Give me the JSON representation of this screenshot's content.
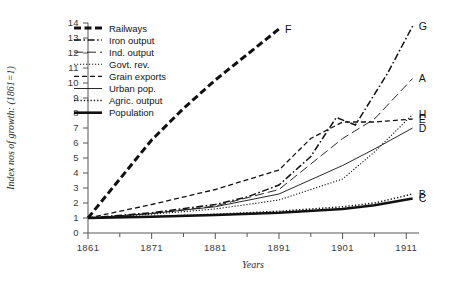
{
  "chart_data": {
    "type": "line",
    "title": "",
    "xlabel": "Years",
    "ylabel": "Index nos of growth: (1861=1)",
    "xlim": [
      1861,
      1913
    ],
    "ylim": [
      0,
      14
    ],
    "xticks": [
      1861,
      1871,
      1881,
      1891,
      1901,
      1911
    ],
    "xticklabels": [
      "1861",
      "1871",
      "1881",
      "1891",
      "1901",
      "1911"
    ],
    "xminorticks": [
      1866,
      1876,
      1886,
      1896,
      1906
    ],
    "yticks": [
      0,
      1,
      2,
      3,
      4,
      5,
      6,
      7,
      8,
      9,
      10,
      11,
      12,
      13,
      14
    ],
    "yticklabels": [
      "0",
      "1",
      "2",
      "3",
      "4",
      "5",
      "6",
      "7",
      "8",
      "9",
      "10",
      "11",
      "12",
      "13",
      "14"
    ],
    "grid": false,
    "legend_position": "upper-left-inside",
    "series": [
      {
        "name": "Railways",
        "end_label": "F",
        "style": "thick-dashed",
        "x": [
          1861,
          1866,
          1871,
          1876,
          1881,
          1886,
          1891
        ],
        "values": [
          1.0,
          3.6,
          6.2,
          8.3,
          10.2,
          11.9,
          13.6
        ]
      },
      {
        "name": "Iron output",
        "end_label": "G",
        "style": "dash-dot",
        "x": [
          1861,
          1871,
          1881,
          1886,
          1891,
          1896,
          1900,
          1903,
          1908,
          1912
        ],
        "values": [
          1.0,
          1.35,
          1.9,
          2.4,
          3.2,
          5.1,
          7.7,
          7.2,
          10.6,
          13.8
        ]
      },
      {
        "name": "Ind. output",
        "end_label": "A",
        "style": "long-dash",
        "x": [
          1861,
          1871,
          1881,
          1891,
          1896,
          1901,
          1906,
          1912
        ],
        "values": [
          1.0,
          1.3,
          1.8,
          2.9,
          4.6,
          6.3,
          7.6,
          10.3
        ]
      },
      {
        "name": "Govt. rev.",
        "end_label": "H",
        "style": "dash-dot-dot",
        "x": [
          1861,
          1871,
          1881,
          1891,
          1901,
          1906,
          1912
        ],
        "values": [
          1.0,
          1.25,
          1.6,
          2.2,
          3.6,
          5.4,
          7.9
        ]
      },
      {
        "name": "Grain exports",
        "end_label": "E",
        "style": "dashed",
        "x": [
          1861,
          1871,
          1881,
          1891,
          1896,
          1901,
          1906,
          1912
        ],
        "values": [
          1.0,
          1.9,
          2.9,
          4.2,
          6.3,
          7.4,
          7.4,
          7.6
        ]
      },
      {
        "name": "Urban pop.",
        "end_label": "D",
        "style": "thin-solid",
        "x": [
          1861,
          1871,
          1881,
          1891,
          1901,
          1906,
          1912
        ],
        "values": [
          1.0,
          1.3,
          1.75,
          2.6,
          4.5,
          5.6,
          7.0
        ]
      },
      {
        "name": "Agric. output",
        "end_label": "B",
        "style": "dotted",
        "x": [
          1861,
          1871,
          1881,
          1891,
          1901,
          1906,
          1912
        ],
        "values": [
          1.0,
          1.1,
          1.25,
          1.45,
          1.75,
          2.0,
          2.6
        ]
      },
      {
        "name": "Population",
        "end_label": "C",
        "style": "thick-solid",
        "x": [
          1861,
          1871,
          1881,
          1891,
          1901,
          1906,
          1912
        ],
        "values": [
          1.0,
          1.08,
          1.2,
          1.35,
          1.6,
          1.85,
          2.3
        ]
      }
    ]
  },
  "legend": {
    "items": [
      {
        "label": "Railways"
      },
      {
        "label": "Iron output"
      },
      {
        "label": "Ind. output"
      },
      {
        "label": "Govt. rev."
      },
      {
        "label": "Grain exports"
      },
      {
        "label": "Urban pop."
      },
      {
        "label": "Agric. output"
      },
      {
        "label": "Population"
      }
    ]
  },
  "colors": {
    "ink": "#111111",
    "axis": "#55565a",
    "background": "#ffffff"
  }
}
